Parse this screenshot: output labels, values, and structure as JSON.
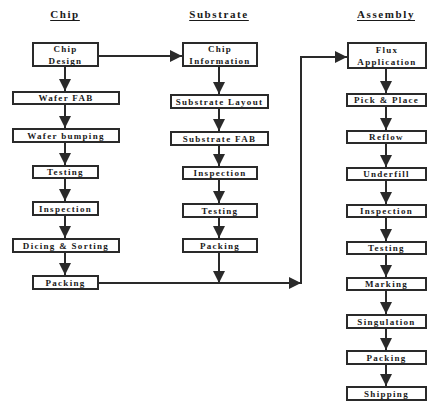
{
  "headers": {
    "chip": "Chip",
    "substrate": "Substrate",
    "assembly": "Assembly"
  },
  "chip": {
    "steps": [
      {
        "label": "Chip\nDesign"
      },
      {
        "label": "Wafer FAB"
      },
      {
        "label": "Wafer bumping"
      },
      {
        "label": "Testing"
      },
      {
        "label": "Inspection"
      },
      {
        "label": "Dicing & Sorting"
      },
      {
        "label": "Packing"
      }
    ]
  },
  "substrate": {
    "steps": [
      {
        "label": "Chip\nInformation"
      },
      {
        "label": "Substrate Layout"
      },
      {
        "label": "Substrate FAB"
      },
      {
        "label": "Inspection"
      },
      {
        "label": "Testing"
      },
      {
        "label": "Packing"
      }
    ]
  },
  "assembly": {
    "steps": [
      {
        "label": "Flux\nApplication"
      },
      {
        "label": "Pick & Place"
      },
      {
        "label": "Reflow"
      },
      {
        "label": "Underfill"
      },
      {
        "label": "Inspection"
      },
      {
        "label": "Testing"
      },
      {
        "label": "Marking"
      },
      {
        "label": "Singulation"
      },
      {
        "label": "Packing"
      },
      {
        "label": "Shipping"
      }
    ]
  },
  "connectors": [
    {
      "from": "Chip Design",
      "to": "Chip Information"
    },
    {
      "from": "Chip Packing",
      "to": "Flux Application"
    },
    {
      "from": "Substrate Packing",
      "to": "Flux Application"
    }
  ],
  "colors": {
    "line": "#2a2a2a",
    "background": "#ffffff"
  }
}
